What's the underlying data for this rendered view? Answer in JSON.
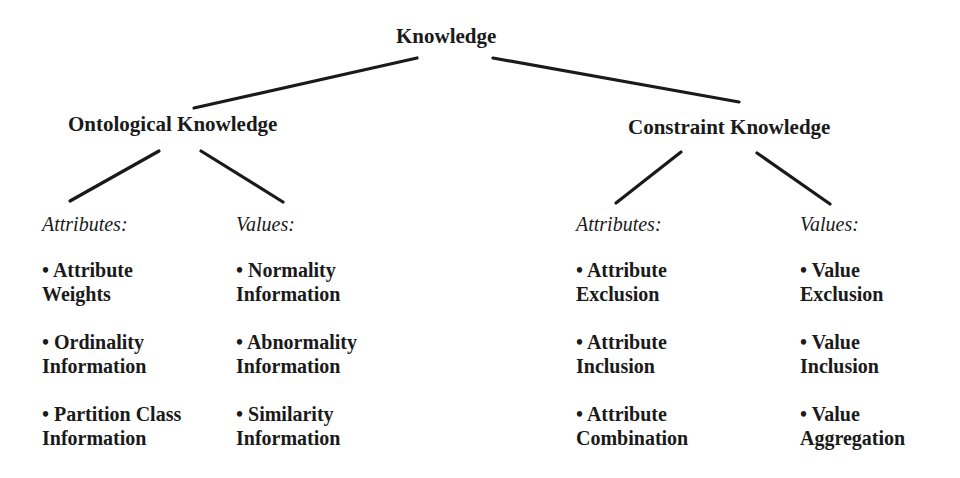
{
  "root": {
    "label": "Knowledge"
  },
  "branches": [
    {
      "label": "Ontological Knowledge",
      "groups": [
        {
          "heading": "Attributes:",
          "items": [
            {
              "line1": "• Attribute",
              "line2": "Weights"
            },
            {
              "line1": "• Ordinality",
              "line2": "Information"
            },
            {
              "line1": "• Partition Class",
              "line2": "Information"
            }
          ]
        },
        {
          "heading": "Values:",
          "items": [
            {
              "line1": "• Normality",
              "line2": "Information"
            },
            {
              "line1": "• Abnormality",
              "line2": "Information"
            },
            {
              "line1": "• Similarity",
              "line2": "Information"
            }
          ]
        }
      ]
    },
    {
      "label": "Constraint Knowledge",
      "groups": [
        {
          "heading": "Attributes:",
          "items": [
            {
              "line1": "• Attribute",
              "line2": "Exclusion"
            },
            {
              "line1": "• Attribute",
              "line2": "Inclusion"
            },
            {
              "line1": "• Attribute",
              "line2": "Combination"
            }
          ]
        },
        {
          "heading": "Values:",
          "items": [
            {
              "line1": "• Value",
              "line2": "Exclusion"
            },
            {
              "line1": "• Value",
              "line2": "Inclusion"
            },
            {
              "line1": "• Value",
              "line2": "Aggregation"
            }
          ]
        }
      ]
    }
  ]
}
